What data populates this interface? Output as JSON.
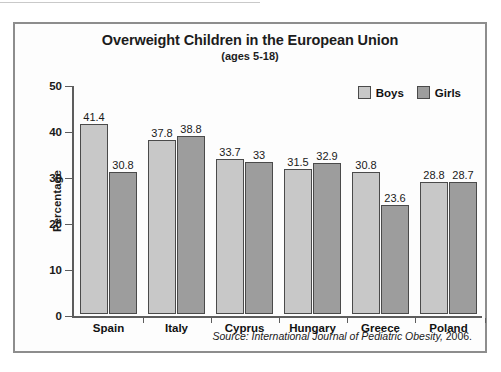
{
  "chart_data": {
    "type": "bar",
    "title": "Overweight Children in the European Union",
    "subtitle": "(ages 5-18)",
    "xlabel": "",
    "ylabel": "Percentage",
    "ylim": [
      0,
      50
    ],
    "yticks": [
      0,
      10,
      20,
      30,
      40,
      50
    ],
    "grid": false,
    "legend_position": "top-right",
    "categories": [
      "Spain",
      "Italy",
      "Cyprus",
      "Hungary",
      "Greece",
      "Poland"
    ],
    "series": [
      {
        "name": "Boys",
        "color": "#c8c8c8",
        "values": [
          41.4,
          37.8,
          33.7,
          31.5,
          30.8,
          28.8
        ]
      },
      {
        "name": "Girls",
        "color": "#9d9d9d",
        "values": [
          30.8,
          38.8,
          33,
          32.9,
          23.6,
          28.7
        ]
      }
    ],
    "value_labels": {
      "Spain": [
        "41.4",
        "30.8"
      ],
      "Italy": [
        "37.8",
        "38.8"
      ],
      "Cyprus": [
        "33.7",
        "33"
      ],
      "Hungary": [
        "31.5",
        "32.9"
      ],
      "Greece": [
        "30.8",
        "23.6"
      ],
      "Poland": [
        "28.8",
        "28.7"
      ]
    },
    "annotations": [
      {
        "name": "source-note",
        "text": "Source: International Journal of Pediatric Obesity, 2006."
      }
    ]
  },
  "source": {
    "prefix": "Source: International Journal of Pediatric Obesity,",
    "year": " 2006."
  }
}
